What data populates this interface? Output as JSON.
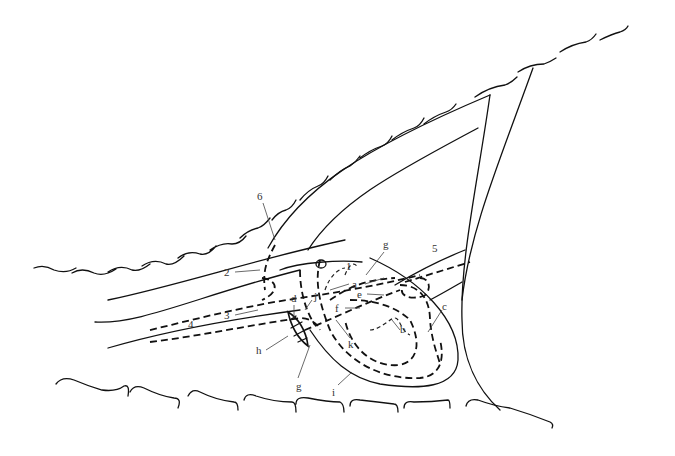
{
  "diagram": {
    "type": "line schematic",
    "style": "black ink on white, solid and dashed curves",
    "colors": {
      "ink": "#111111",
      "label": "#333333",
      "background": "#ffffff"
    },
    "labels": {
      "n1": "1",
      "n2": "2",
      "n3": "3",
      "n4": "4",
      "n5": "5",
      "n6": "6",
      "a": "a",
      "b": "b",
      "c": "c",
      "d": "d",
      "e": "e",
      "f": "f",
      "g_top": "g",
      "g_bottom": "g",
      "h": "h",
      "i": "i",
      "j": "j",
      "k": "k"
    }
  }
}
